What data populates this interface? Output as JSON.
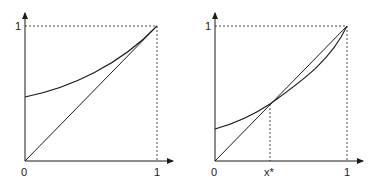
{
  "panels": [
    {
      "id": "left",
      "axis_labels": {
        "x_zero": "0",
        "x_one": "1",
        "y_one": "1"
      },
      "curves": [
        {
          "name": "diagonal",
          "type": "line",
          "from": [
            0,
            0
          ],
          "to": [
            1,
            1
          ]
        },
        {
          "name": "convex-curve",
          "type": "curve",
          "start_y": 0.47,
          "end": [
            1,
            1
          ]
        }
      ]
    },
    {
      "id": "right",
      "axis_labels": {
        "x_zero": "0",
        "x_one": "1",
        "y_one": "1",
        "x_star": "x*"
      },
      "curves": [
        {
          "name": "diagonal",
          "type": "line",
          "from": [
            0,
            0
          ],
          "to": [
            1,
            1
          ]
        },
        {
          "name": "convex-curve",
          "type": "curve",
          "start_y": 0.24,
          "crosses_diagonal_at": 0.42,
          "end": [
            1,
            1
          ]
        }
      ]
    }
  ],
  "colors": {
    "line": "#1a1a1a",
    "background": "#ffffff"
  }
}
